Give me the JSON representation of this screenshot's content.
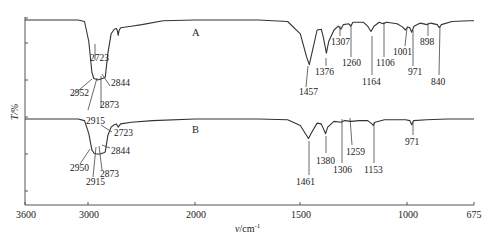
{
  "chart_data": {
    "type": "line",
    "title": "",
    "xlabel": "ν/cm⁻¹",
    "ylabel": "T/%",
    "x_ticks": [
      3600,
      3000,
      2000,
      1500,
      1000,
      675
    ],
    "xlim": [
      3600,
      675
    ],
    "x_axis_note": "scale change at 2000 cm-1 (2x expansion below 2000)",
    "grid": false,
    "legend": "inline labels A and B",
    "series": [
      {
        "name": "A",
        "peaks": [
          2952,
          2915,
          2873,
          2844,
          2723,
          1457,
          1376,
          1307,
          1260,
          1164,
          1106,
          1001,
          971,
          898,
          840
        ],
        "points": [
          [
            3600,
            98
          ],
          [
            3100,
            98
          ],
          [
            3040,
            96
          ],
          [
            3000,
            70
          ],
          [
            2970,
            30
          ],
          [
            2952,
            22
          ],
          [
            2930,
            21
          ],
          [
            2915,
            20
          ],
          [
            2895,
            21
          ],
          [
            2873,
            22
          ],
          [
            2850,
            23
          ],
          [
            2844,
            24
          ],
          [
            2820,
            55
          ],
          [
            2790,
            80
          ],
          [
            2760,
            86
          ],
          [
            2740,
            87
          ],
          [
            2730,
            84
          ],
          [
            2723,
            78
          ],
          [
            2715,
            84
          ],
          [
            2700,
            88
          ],
          [
            2600,
            90
          ],
          [
            2500,
            92
          ],
          [
            2300,
            97
          ],
          [
            2000,
            98
          ],
          [
            1700,
            98
          ],
          [
            1560,
            96
          ],
          [
            1500,
            80
          ],
          [
            1470,
            50
          ],
          [
            1457,
            40
          ],
          [
            1445,
            55
          ],
          [
            1420,
            85
          ],
          [
            1400,
            86
          ],
          [
            1390,
            75
          ],
          [
            1376,
            55
          ],
          [
            1365,
            70
          ],
          [
            1340,
            85
          ],
          [
            1320,
            90
          ],
          [
            1307,
            86
          ],
          [
            1295,
            92
          ],
          [
            1270,
            93
          ],
          [
            1260,
            90
          ],
          [
            1250,
            95
          ],
          [
            1200,
            95
          ],
          [
            1180,
            90
          ],
          [
            1164,
            83
          ],
          [
            1150,
            90
          ],
          [
            1125,
            95
          ],
          [
            1106,
            93
          ],
          [
            1090,
            95
          ],
          [
            1040,
            93
          ],
          [
            1015,
            89
          ],
          [
            1001,
            85
          ],
          [
            990,
            89
          ],
          [
            980,
            88
          ],
          [
            971,
            82
          ],
          [
            960,
            90
          ],
          [
            930,
            94
          ],
          [
            898,
            92
          ],
          [
            880,
            94
          ],
          [
            850,
            92
          ],
          [
            840,
            88
          ],
          [
            830,
            92
          ],
          [
            780,
            96
          ],
          [
            700,
            97
          ],
          [
            675,
            97
          ]
        ]
      },
      {
        "name": "B",
        "peaks": [
          2950,
          2915,
          2873,
          2844,
          2723,
          1461,
          1380,
          1306,
          1259,
          1153,
          971
        ],
        "points": [
          [
            3600,
            98
          ],
          [
            3100,
            98
          ],
          [
            3040,
            96
          ],
          [
            3000,
            80
          ],
          [
            2970,
            60
          ],
          [
            2950,
            56
          ],
          [
            2930,
            55
          ],
          [
            2915,
            55
          ],
          [
            2895,
            55
          ],
          [
            2873,
            56
          ],
          [
            2850,
            57
          ],
          [
            2844,
            58
          ],
          [
            2820,
            78
          ],
          [
            2790,
            88
          ],
          [
            2760,
            91
          ],
          [
            2740,
            92
          ],
          [
            2723,
            88
          ],
          [
            2700,
            92
          ],
          [
            2600,
            94
          ],
          [
            2400,
            96
          ],
          [
            2000,
            98
          ],
          [
            1700,
            98
          ],
          [
            1560,
            97
          ],
          [
            1500,
            90
          ],
          [
            1475,
            80
          ],
          [
            1461,
            74
          ],
          [
            1445,
            82
          ],
          [
            1420,
            93
          ],
          [
            1400,
            92
          ],
          [
            1380,
            80
          ],
          [
            1370,
            88
          ],
          [
            1340,
            95
          ],
          [
            1306,
            94
          ],
          [
            1290,
            96
          ],
          [
            1259,
            95
          ],
          [
            1220,
            96
          ],
          [
            1180,
            96
          ],
          [
            1160,
            92
          ],
          [
            1153,
            90
          ],
          [
            1145,
            94
          ],
          [
            1100,
            97
          ],
          [
            1000,
            97
          ],
          [
            980,
            96
          ],
          [
            971,
            91
          ],
          [
            962,
            96
          ],
          [
            900,
            97
          ],
          [
            800,
            98
          ],
          [
            700,
            98
          ],
          [
            675,
            98
          ]
        ]
      }
    ],
    "annotations": {
      "A": [
        {
          "label": "2723",
          "x": 2723
        },
        {
          "label": "2952",
          "x": 2952
        },
        {
          "label": "2844",
          "x": 2844
        },
        {
          "label": "2873",
          "x": 2873
        },
        {
          "label": "2915",
          "x": 2915
        },
        {
          "label": "1457",
          "x": 1457
        },
        {
          "label": "1376",
          "x": 1376
        },
        {
          "label": "1307",
          "x": 1307
        },
        {
          "label": "1260",
          "x": 1260
        },
        {
          "label": "1164",
          "x": 1164
        },
        {
          "label": "1106",
          "x": 1106
        },
        {
          "label": "1001",
          "x": 1001
        },
        {
          "label": "971",
          "x": 971
        },
        {
          "label": "898",
          "x": 898
        },
        {
          "label": "840",
          "x": 840
        }
      ],
      "B": [
        {
          "label": "2723",
          "x": 2723
        },
        {
          "label": "2950",
          "x": 2950
        },
        {
          "label": "2844",
          "x": 2844
        },
        {
          "label": "2873",
          "x": 2873
        },
        {
          "label": "2915",
          "x": 2915
        },
        {
          "label": "1461",
          "x": 1461
        },
        {
          "label": "1380",
          "x": 1380
        },
        {
          "label": "1306",
          "x": 1306
        },
        {
          "label": "1259",
          "x": 1259
        },
        {
          "label": "1153",
          "x": 1153
        },
        {
          "label": "971",
          "x": 971
        }
      ]
    }
  },
  "labels": {
    "series_a": "A",
    "series_b": "B",
    "y_axis": "T/%",
    "x_axis_nu": "ν",
    "x_axis_unit": "/cm",
    "x_axis_exp": "-1",
    "x_ticks": [
      "3600",
      "3000",
      "2000",
      "1500",
      "1000",
      "675"
    ]
  },
  "colors": {
    "line": "#333333",
    "axis": "#555555",
    "text": "#222222"
  }
}
